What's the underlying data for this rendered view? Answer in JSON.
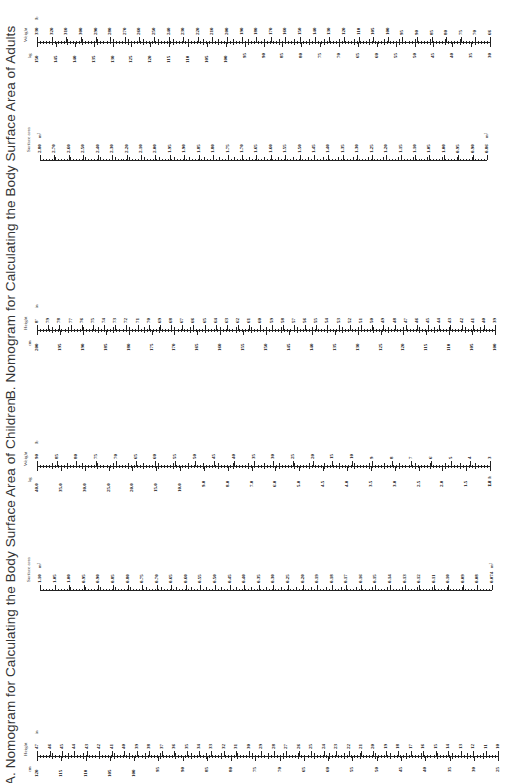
{
  "sections": {
    "adults": {
      "title": "B. Nomogram for Calculating the Body Surface Area of Adults",
      "weight": {
        "title": "Weight",
        "unit_top": "lb",
        "unit_bottom": "kg",
        "top_labels": [
          "330",
          "320",
          "310",
          "300",
          "290",
          "280",
          "270",
          "260",
          "250",
          "240",
          "230",
          "220",
          "210",
          "200",
          "190",
          "180",
          "170",
          "160",
          "150",
          "140",
          "130",
          "120",
          "110",
          "105",
          "100",
          "95",
          "90",
          "85",
          "80",
          "75",
          "70",
          "66"
        ],
        "bottom_labels": [
          "150",
          "145",
          "140",
          "135",
          "130",
          "125",
          "120",
          "115",
          "110",
          "105",
          "100",
          "95",
          "90",
          "85",
          "80",
          "75",
          "70",
          "65",
          "60",
          "55",
          "50",
          "45",
          "40",
          "35",
          "30"
        ]
      },
      "surface_area": {
        "title": "Surface area",
        "unit_start": "m²",
        "unit_end": "m²",
        "labels": [
          "2.80",
          "2.70",
          "2.60",
          "2.50",
          "2.40",
          "2.30",
          "2.20",
          "2.10",
          "2.00",
          "1.95",
          "1.90",
          "1.85",
          "1.80",
          "1.75",
          "1.70",
          "1.65",
          "1.60",
          "1.55",
          "1.50",
          "1.45",
          "1.40",
          "1.35",
          "1.30",
          "1.25",
          "1.20",
          "1.15",
          "1.10",
          "1.05",
          "1.00",
          "0.95",
          "0.90",
          "0.86"
        ]
      },
      "height": {
        "title": "Height",
        "unit_top": "in",
        "unit_bottom": "cm",
        "top_labels": [
          "8'",
          "79",
          "78",
          "77",
          "76",
          "75",
          "74",
          "73",
          "72",
          "71",
          "70",
          "69",
          "68",
          "67",
          "66",
          "65",
          "64",
          "63",
          "62",
          "61",
          "60",
          "59",
          "58",
          "57",
          "56",
          "55",
          "54",
          "53",
          "52",
          "51",
          "50",
          "49",
          "48",
          "47",
          "46",
          "45",
          "44",
          "43",
          "42",
          "41",
          "40",
          "39"
        ],
        "bottom_labels": [
          "200",
          "195",
          "190",
          "185",
          "180",
          "175",
          "170",
          "165",
          "160",
          "155",
          "150",
          "145",
          "140",
          "135",
          "130",
          "125",
          "120",
          "115",
          "110",
          "105",
          "100"
        ]
      }
    },
    "children": {
      "title": "A. Nomogram for Calculating the Body Surface Area of Children",
      "weight": {
        "title": "Weight",
        "unit_top": "lb",
        "unit_bottom": "kg",
        "end_label": "2.2 lb",
        "top_labels": [
          "90",
          "85",
          "80",
          "75",
          "70",
          "65",
          "60",
          "55",
          "50",
          "45",
          "40",
          "35",
          "30",
          "25",
          "20",
          "15",
          "10",
          "9",
          "8",
          "7",
          "6",
          "5",
          "4",
          "3"
        ],
        "bottom_labels": [
          "40.0",
          "35.0",
          "30.0",
          "25.0",
          "20.0",
          "15.0",
          "10.0",
          "9.0",
          "8.0",
          "7.0",
          "6.0",
          "5.0",
          "4.5",
          "4.0",
          "3.5",
          "3.0",
          "2.5",
          "2.0",
          "1.5",
          "1.0"
        ]
      },
      "surface_area": {
        "title": "Surface area",
        "unit_start": "m²",
        "unit_end": "m²",
        "labels": [
          "1.10",
          "1.05",
          "1.00",
          "0.95",
          "0.90",
          "0.85",
          "0.80",
          "0.75",
          "0.70",
          "0.65",
          "0.60",
          "0.55",
          "0.50",
          "0.45",
          "0.40",
          "0.35",
          "0.30",
          "0.25",
          "0.20",
          "0.19",
          "0.18",
          "0.17",
          "0.16",
          "0.15",
          "0.14",
          "0.13",
          "0.12",
          "0.11",
          "0.10",
          "0.09",
          "0.08",
          "0.074"
        ]
      },
      "height": {
        "title": "Height",
        "unit_top": "in",
        "unit_bottom": "cm",
        "top_labels": [
          "47",
          "46",
          "45",
          "44",
          "43",
          "42",
          "41",
          "40",
          "39",
          "38",
          "37",
          "36",
          "35",
          "34",
          "33",
          "32",
          "31",
          "30",
          "29",
          "28",
          "27",
          "26",
          "25",
          "24",
          "23",
          "22",
          "21",
          "20",
          "19",
          "18",
          "17",
          "16",
          "15",
          "14",
          "13",
          "12",
          "11",
          "10"
        ],
        "bottom_labels": [
          "120",
          "115",
          "110",
          "105",
          "100",
          "95",
          "90",
          "85",
          "80",
          "75",
          "70",
          "65",
          "60",
          "55",
          "50",
          "45",
          "40",
          "35",
          "30",
          "25"
        ]
      }
    }
  }
}
